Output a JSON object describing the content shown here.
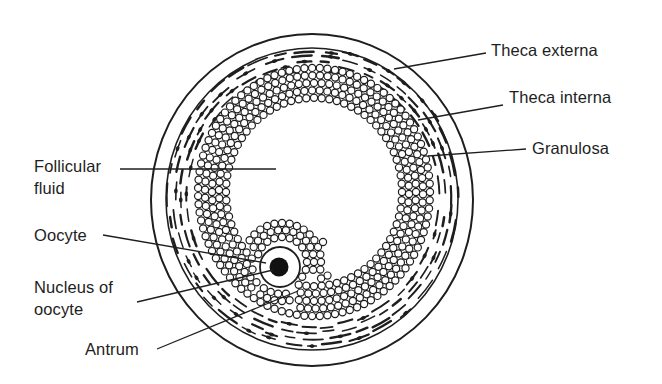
{
  "figure": {
    "colors": {
      "ink": "#1e1e1e",
      "background": "#ffffff"
    }
  },
  "labels": {
    "theca_externa": "Theca externa",
    "theca_interna": "Theca interna",
    "granulosa": "Granulosa",
    "follicular_fluid_line1": "Follicular",
    "follicular_fluid_line2": "fluid",
    "oocyte": "Oocyte",
    "nucleus_line1": "Nucleus of",
    "nucleus_line2": "oocyte",
    "antrum": "Antrum"
  }
}
